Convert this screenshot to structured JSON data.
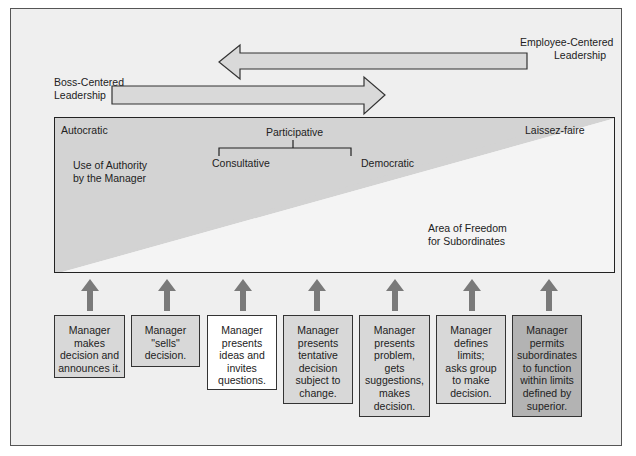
{
  "diagram": {
    "type": "leadership-continuum",
    "colors": {
      "background": "#efefef",
      "shaded_authority": "#d3d3d3",
      "arrow_fill": "#d9d9d9",
      "up_arrow": "#7a7a7a",
      "box_light": "#d8d8d8",
      "box_white": "#ffffff",
      "box_dark": "#b3b3b3"
    },
    "top_arrows": {
      "left_label": "Boss-Centered\nLeadership",
      "left_label_line1": "Boss-Centered",
      "left_label_line2": "Leadership",
      "right_label_line1": "Employee-Centered",
      "right_label_line2": "Leadership"
    },
    "panel": {
      "left_style": "Autocratic",
      "middle_style": "Participative",
      "middle_sub_left": "Consultative",
      "middle_sub_right": "Democratic",
      "right_style": "Laissez-faire",
      "authority_line1": "Use of Authority",
      "authority_line2": "by the Manager",
      "freedom_line1": "Area of Freedom",
      "freedom_line2": "for Subordinates"
    },
    "behaviors": [
      {
        "text": "Manager\nmakes\ndecision and\nannounces it.",
        "shade": "light"
      },
      {
        "text": "Manager\n\"sells\"\ndecision.",
        "shade": "light"
      },
      {
        "text": "Manager\npresents\nideas and\ninvites\nquestions.",
        "shade": "white"
      },
      {
        "text": "Manager\npresents\ntentative\ndecision\nsubject to\nchange.",
        "shade": "light"
      },
      {
        "text": "Manager\npresents\nproblem,\ngets\nsuggestions,\nmakes\ndecision.",
        "shade": "light"
      },
      {
        "text": "Manager\ndefines\nlimits;\nasks group\nto make\ndecision.",
        "shade": "light"
      },
      {
        "text": "Manager\npermits\nsubordinates\nto function\nwithin limits\ndefined by\nsuperior.",
        "shade": "dark"
      }
    ]
  }
}
